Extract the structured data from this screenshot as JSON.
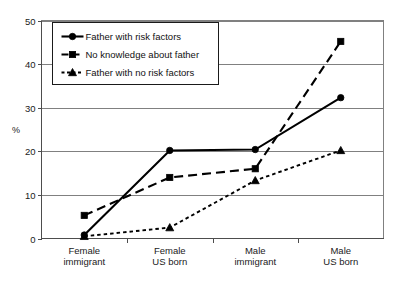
{
  "chart_data": {
    "type": "line",
    "title": "",
    "xlabel": "",
    "ylabel": "%",
    "ylim": [
      0,
      50
    ],
    "yticks": [
      0,
      10,
      20,
      30,
      40,
      50
    ],
    "grid": true,
    "legend_position": "upper-left-inside",
    "categories": [
      "Female immigrant",
      "Female US born",
      "Male immigrant",
      "Male US born"
    ],
    "category_lines": [
      [
        "Female",
        "immigrant"
      ],
      [
        "Female",
        "US born"
      ],
      [
        "Male",
        "immigrant"
      ],
      [
        "Male",
        "US born"
      ]
    ],
    "series": [
      {
        "name": "Father with risk factors",
        "marker": "circle",
        "line_style": "solid",
        "values": [
          0.8,
          20.2,
          20.4,
          32.3
        ]
      },
      {
        "name": "No knowledge about father",
        "marker": "square",
        "line_style": "dashed",
        "values": [
          5.3,
          14.0,
          16.0,
          45.2
        ]
      },
      {
        "name": "Father with no risk factors",
        "marker": "triangle",
        "line_style": "dotted",
        "values": [
          0.5,
          2.5,
          13.3,
          20.2
        ]
      }
    ]
  },
  "axis": {
    "y_title": "%",
    "y_tick_labels": [
      "0",
      "10",
      "20",
      "30",
      "40",
      "50"
    ]
  },
  "legend": {
    "entries": [
      "Father with risk factors",
      "No knowledge about father",
      "Father with no risk factors"
    ]
  },
  "colors": {
    "series": "#000000",
    "gridline": "#808080",
    "axis": "#4d4d4d",
    "text": "#1a1a1a",
    "background": "#ffffff"
  },
  "caption": {
    "text": ""
  }
}
